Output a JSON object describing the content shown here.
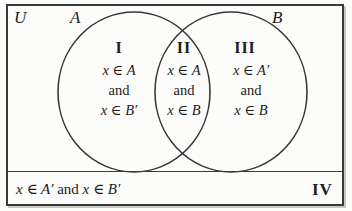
{
  "diagram": {
    "type": "venn-two-set",
    "universe_label": "U",
    "set_a_label": "A",
    "set_b_label": "B",
    "regions": [
      {
        "numeral": "I",
        "name": "a-only",
        "lines": [
          "x ∈ A",
          "and",
          "x ∈ B′"
        ]
      },
      {
        "numeral": "II",
        "name": "intersection",
        "lines": [
          "x ∈ A",
          "and",
          "x ∈ B"
        ]
      },
      {
        "numeral": "III",
        "name": "b-only",
        "lines": [
          "x ∈ A′",
          "and",
          "x ∈ B"
        ]
      },
      {
        "numeral": "IV",
        "name": "outside-both",
        "caption_prefix": "x ∈ A′ ",
        "caption_conjunction": "and",
        "caption_suffix": " x ∈ B′"
      }
    ],
    "colors": {
      "stroke": "#3a3a3a",
      "text": "#1d1d1d",
      "background": "#fcfcfa"
    }
  }
}
